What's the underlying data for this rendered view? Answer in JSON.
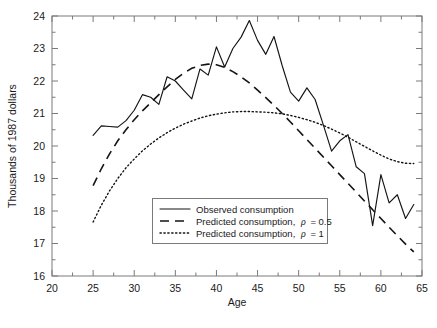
{
  "chart_data": {
    "type": "line",
    "title": "",
    "subtitle": "",
    "xlabel": "Age",
    "ylabel": "Thousands of 1987 dollars",
    "xlim": [
      20,
      65
    ],
    "ylim": [
      16,
      24
    ],
    "xticks": [
      20,
      25,
      30,
      35,
      40,
      45,
      50,
      55,
      60,
      65
    ],
    "yticks": [
      16,
      17,
      18,
      19,
      20,
      21,
      22,
      23,
      24
    ],
    "xtick_labels": [
      "20",
      "25",
      "30",
      "35",
      "40",
      "45",
      "50",
      "55",
      "60",
      "65"
    ],
    "ytick_labels": [
      "16",
      "17",
      "18",
      "19",
      "20",
      "21",
      "22",
      "23",
      "24"
    ],
    "grid": false,
    "minor_ticks": true,
    "legend_position": "lower center",
    "series": [
      {
        "name": "Observed consumption",
        "style": "solid",
        "x": [
          25,
          26,
          27,
          28,
          29,
          30,
          31,
          32,
          33,
          34,
          35,
          36,
          37,
          38,
          39,
          40,
          41,
          42,
          43,
          44,
          45,
          46,
          47,
          48,
          49,
          50,
          51,
          52,
          53,
          54,
          55,
          56,
          57,
          58,
          59,
          60,
          61,
          62,
          63,
          64
        ],
        "values": [
          20.33,
          20.62,
          20.6,
          20.58,
          20.78,
          21.1,
          21.58,
          21.5,
          21.28,
          22.13,
          22.0,
          21.72,
          21.45,
          22.37,
          22.18,
          23.05,
          22.43,
          23.0,
          23.35,
          23.86,
          23.25,
          22.82,
          23.37,
          22.47,
          21.66,
          21.38,
          21.79,
          21.43,
          20.65,
          19.84,
          20.16,
          20.35,
          19.36,
          19.15,
          17.55,
          19.12,
          18.25,
          18.5,
          17.77,
          18.2
        ]
      },
      {
        "name": "Predicted consumption, rho = 0.5",
        "style": "dashed",
        "rho": 0.5,
        "x": [
          25,
          26,
          27,
          28,
          29,
          30,
          31,
          32,
          33,
          34,
          35,
          36,
          37,
          38,
          39,
          40,
          41,
          42,
          43,
          44,
          45,
          46,
          47,
          48,
          49,
          50,
          51,
          52,
          53,
          54,
          55,
          56,
          57,
          58,
          59,
          60,
          61,
          62,
          63,
          64
        ],
        "values": [
          18.78,
          19.3,
          19.76,
          20.16,
          20.5,
          20.81,
          21.08,
          21.33,
          21.58,
          21.82,
          22.05,
          22.24,
          22.39,
          22.48,
          22.52,
          22.5,
          22.42,
          22.29,
          22.13,
          21.94,
          21.72,
          21.49,
          21.25,
          21.0,
          20.74,
          20.47,
          20.2,
          19.93,
          19.66,
          19.39,
          19.12,
          18.85,
          18.58,
          18.31,
          18.04,
          17.77,
          17.5,
          17.24,
          16.98,
          16.74
        ]
      },
      {
        "name": "Predicted consumption, rho = 1",
        "style": "dotted",
        "rho": 1,
        "x": [
          25,
          26,
          27,
          28,
          29,
          30,
          31,
          32,
          33,
          34,
          35,
          36,
          37,
          38,
          39,
          40,
          41,
          42,
          43,
          44,
          45,
          46,
          47,
          48,
          49,
          50,
          51,
          52,
          53,
          54,
          55,
          56,
          57,
          58,
          59,
          60,
          61,
          62,
          63,
          64
        ],
        "values": [
          17.66,
          18.18,
          18.62,
          19.0,
          19.33,
          19.6,
          19.85,
          20.06,
          20.25,
          20.41,
          20.55,
          20.67,
          20.77,
          20.86,
          20.93,
          20.98,
          21.02,
          21.05,
          21.06,
          21.06,
          21.05,
          21.04,
          21.02,
          20.99,
          20.94,
          20.88,
          20.81,
          20.73,
          20.63,
          20.52,
          20.4,
          20.27,
          20.13,
          19.99,
          19.85,
          19.72,
          19.6,
          19.52,
          19.47,
          19.46
        ]
      }
    ]
  },
  "legend": {
    "items": [
      {
        "label": "Observed consumption",
        "suffix": "",
        "style": "solid"
      },
      {
        "label": "Predicted consumption,",
        "suffix": "= 0.5",
        "symbol": "ρ",
        "style": "dashed"
      },
      {
        "label": "Predicted consumption,",
        "suffix": "= 1",
        "symbol": "ρ",
        "style": "dotted"
      }
    ]
  },
  "colors": {
    "background": "#ffffff",
    "line": "#141414",
    "axis": "#7a7a7a",
    "text": "#1a1a1a"
  }
}
